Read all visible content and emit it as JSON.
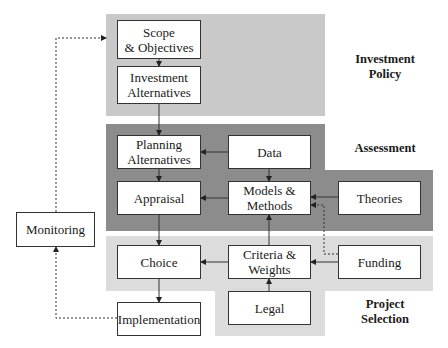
{
  "regions": {
    "investment_policy": {
      "label": "Investment\nPolicy",
      "color": "#c9c9c9"
    },
    "assessment": {
      "label": "Assessment",
      "color": "#8c8c8c"
    },
    "project_selection": {
      "label": "Project\nSelection",
      "color": "#dcdcdc"
    }
  },
  "boxes": {
    "scope": "Scope\n& Objectives",
    "investment_alternatives": "Investment\nAlternatives",
    "planning_alternatives": "Planning\nAlternatives",
    "data": "Data",
    "appraisal": "Appraisal",
    "models_methods": "Models &\nMethods",
    "theories": "Theories",
    "choice": "Choice",
    "criteria_weights": "Criteria &\nWeights",
    "funding": "Funding",
    "legal": "Legal",
    "implementation": "Implementation",
    "monitoring": "Monitoring"
  },
  "edges": [
    {
      "from": "Scope & Objectives",
      "to": "Investment Alternatives",
      "style": "solid"
    },
    {
      "from": "Investment Alternatives",
      "to": "Planning Alternatives",
      "style": "solid"
    },
    {
      "from": "Data",
      "to": "Planning Alternatives",
      "style": "solid"
    },
    {
      "from": "Data",
      "to": "Models & Methods",
      "style": "solid"
    },
    {
      "from": "Planning Alternatives",
      "to": "Appraisal",
      "style": "solid"
    },
    {
      "from": "Models & Methods",
      "to": "Appraisal",
      "style": "solid"
    },
    {
      "from": "Theories",
      "to": "Models & Methods",
      "style": "solid"
    },
    {
      "from": "Funding",
      "to": "Models & Methods",
      "style": "dashed"
    },
    {
      "from": "Appraisal",
      "to": "Choice",
      "style": "solid"
    },
    {
      "from": "Criteria & Weights",
      "to": "Models & Methods",
      "style": "solid"
    },
    {
      "from": "Criteria & Weights",
      "to": "Choice",
      "style": "solid"
    },
    {
      "from": "Funding",
      "to": "Criteria & Weights",
      "style": "solid"
    },
    {
      "from": "Legal",
      "to": "Criteria & Weights",
      "style": "solid"
    },
    {
      "from": "Choice",
      "to": "Implementation",
      "style": "solid"
    },
    {
      "from": "Implementation",
      "to": "Monitoring",
      "style": "dashed"
    },
    {
      "from": "Monitoring",
      "to": "Scope & Objectives",
      "style": "dashed"
    }
  ]
}
